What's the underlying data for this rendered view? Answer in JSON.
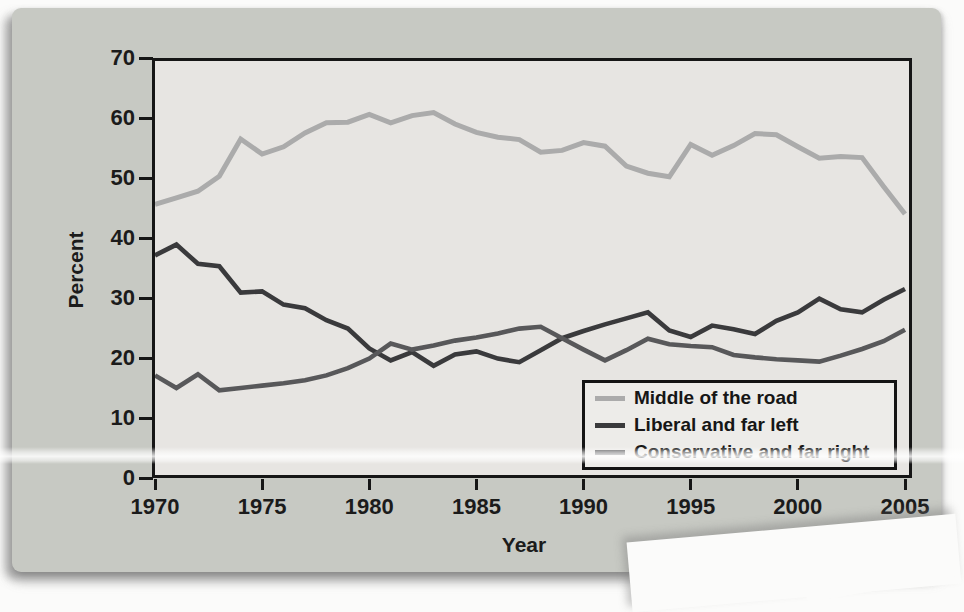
{
  "chart_data": {
    "type": "line",
    "title": "",
    "xlabel": "Year",
    "ylabel": "Percent",
    "xlim": [
      1970,
      2005
    ],
    "ylim": [
      0,
      70
    ],
    "grid": false,
    "legend_position": "inside-bottom-right",
    "x_ticks": [
      1970,
      1975,
      1980,
      1985,
      1990,
      1995,
      2000,
      2005
    ],
    "y_ticks": [
      0,
      10,
      20,
      30,
      40,
      50,
      60,
      70
    ],
    "x": [
      1970,
      1971,
      1972,
      1973,
      1974,
      1975,
      1976,
      1977,
      1978,
      1979,
      1980,
      1981,
      1982,
      1983,
      1984,
      1985,
      1986,
      1987,
      1988,
      1989,
      1990,
      1991,
      1992,
      1993,
      1994,
      1995,
      1996,
      1997,
      1998,
      1999,
      2000,
      2001,
      2002,
      2003,
      2004,
      2005
    ],
    "series": [
      {
        "id": "middle-of-the-road",
        "name": "Middle of the road",
        "color": "#ababab",
        "values": [
          45.6,
          46.7,
          47.8,
          50.3,
          56.5,
          54.0,
          55.2,
          57.5,
          59.2,
          59.3,
          60.6,
          59.2,
          60.4,
          60.9,
          59.0,
          57.6,
          56.8,
          56.4,
          54.3,
          54.6,
          55.9,
          55.3,
          52.0,
          50.8,
          50.2,
          55.6,
          53.8,
          55.4,
          57.4,
          57.2,
          55.2,
          53.3,
          53.6,
          53.4,
          48.6,
          44.0
        ]
      },
      {
        "id": "liberal-and-far-left",
        "name": "Liberal and far left",
        "color": "#3a3a3c",
        "values": [
          37.1,
          38.9,
          35.7,
          35.3,
          30.9,
          31.1,
          28.9,
          28.3,
          26.3,
          24.9,
          21.6,
          19.6,
          21.0,
          18.7,
          20.6,
          21.1,
          19.9,
          19.3,
          21.3,
          23.3,
          24.5,
          25.6,
          26.6,
          27.6,
          24.6,
          23.5,
          25.4,
          24.8,
          24.0,
          26.2,
          27.6,
          29.9,
          28.1,
          27.6,
          29.7,
          31.5
        ]
      },
      {
        "id": "conservative-and-far-right",
        "name": "Conservative and far right",
        "color": "#58585a",
        "values": [
          17.1,
          15.0,
          17.3,
          14.6,
          15.0,
          15.4,
          15.8,
          16.3,
          17.1,
          18.3,
          19.9,
          22.4,
          21.4,
          22.1,
          22.9,
          23.4,
          24.1,
          24.9,
          25.2,
          23.3,
          21.4,
          19.6,
          21.3,
          23.2,
          22.3,
          22.0,
          21.8,
          20.5,
          20.1,
          19.8,
          19.6,
          19.4,
          20.4,
          21.5,
          22.8,
          24.7
        ]
      }
    ]
  }
}
